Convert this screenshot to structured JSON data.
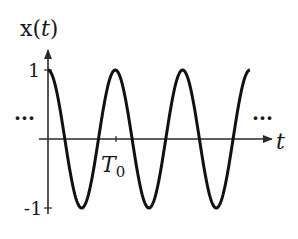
{
  "chart_data": {
    "type": "line",
    "title": "",
    "ylabel": "x(t)",
    "xlabel": "t",
    "function": "cos(2*pi*t/T0)",
    "x_range_periods": [
      0,
      3.0
    ],
    "ylim": [
      -1,
      1
    ],
    "y_ticks": [
      {
        "value": 1,
        "label": "1"
      },
      {
        "value": -1,
        "label": "-1"
      }
    ],
    "x_ticks": [
      {
        "value": 1,
        "label": "T",
        "subscript": "0"
      }
    ],
    "ellipsis_left": "···",
    "ellipsis_right": "···",
    "series": [
      {
        "name": "x(t)",
        "amplitude": 1,
        "period_label": "T0",
        "periods_shown": 3.0
      }
    ],
    "grid": false
  },
  "colors": {
    "axis": "#2a2a2a",
    "curve": "#111111"
  }
}
